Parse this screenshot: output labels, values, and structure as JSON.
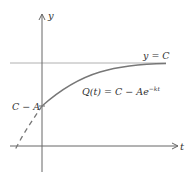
{
  "diagram": {
    "title": "",
    "axes": {
      "x_label": "t",
      "y_label": "y"
    },
    "asymptote": {
      "label": "y = C"
    },
    "curve": {
      "label_lhs": "Q(t) = C − Ae",
      "label_exp": "−kt"
    },
    "intercept": {
      "label": "C − A"
    },
    "colors": {
      "axis": "#666666",
      "curve": "#777777",
      "asymptote": "#aaaaaa",
      "text": "#333333"
    }
  }
}
